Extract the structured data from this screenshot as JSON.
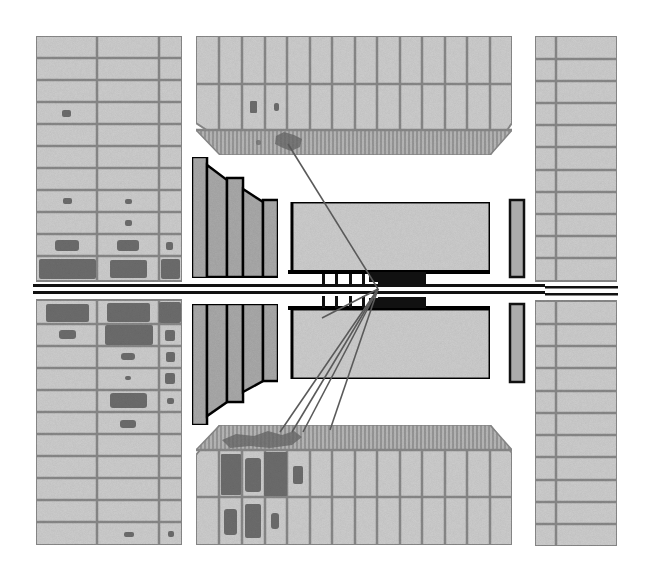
{
  "diagram": {
    "type": "particle-detector-event-display",
    "view": "side cross-section",
    "colors": {
      "background": "#ffffff",
      "cell_fill": "#cfcfcf",
      "cell_grid": "#8a8a8a",
      "energy_deposit": "#6e6e6e",
      "endcap_fill": "#a9a9a9",
      "endcap_shadow": "#8f8f8f",
      "outline": "#111111",
      "beam_pipe": "#111111",
      "track": "#5a5a5a"
    },
    "components": [
      {
        "id": "left-muon-calorimeter",
        "label": ""
      },
      {
        "id": "top-barrel-calorimeter",
        "label": ""
      },
      {
        "id": "bottom-barrel-calorimeter",
        "label": ""
      },
      {
        "id": "right-muon-calorimeter",
        "label": ""
      },
      {
        "id": "forward-endcap-upper",
        "label": ""
      },
      {
        "id": "forward-endcap-lower",
        "label": ""
      },
      {
        "id": "inner-tracker-upper",
        "label": ""
      },
      {
        "id": "inner-tracker-lower",
        "label": ""
      },
      {
        "id": "right-small-detector-upper",
        "label": ""
      },
      {
        "id": "right-small-detector-lower",
        "label": ""
      },
      {
        "id": "beam-pipe",
        "label": ""
      },
      {
        "id": "particle-tracks",
        "label": ""
      }
    ],
    "tracks_count": 6,
    "text_labels": []
  }
}
